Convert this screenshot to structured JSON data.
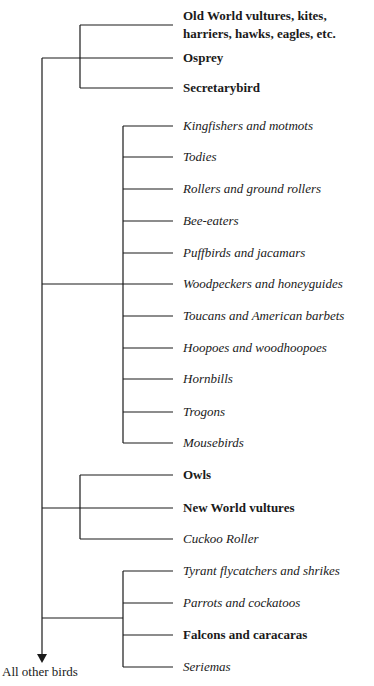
{
  "diagram": {
    "type": "cladogram",
    "root_label": "All other birds",
    "clades": [
      {
        "name": "clade-raptors-accipitriformes",
        "leaves": [
          {
            "label": "Old World vultures, kites, harriers, hawks, eagles, etc.",
            "style": "bold"
          },
          {
            "label": "Osprey",
            "style": "bold"
          },
          {
            "label": "Secretarybird",
            "style": "bold"
          }
        ]
      },
      {
        "name": "clade-coraciimorphae",
        "leaves": [
          {
            "label": "Kingfishers and motmots",
            "style": "italic"
          },
          {
            "label": "Todies",
            "style": "italic"
          },
          {
            "label": "Rollers and ground rollers",
            "style": "italic"
          },
          {
            "label": "Bee-eaters",
            "style": "italic"
          },
          {
            "label": "Puffbirds and jacamars",
            "style": "italic"
          },
          {
            "label": "Woodpeckers and honeyguides",
            "style": "italic"
          },
          {
            "label": "Toucans and American barbets",
            "style": "italic"
          },
          {
            "label": "Hoopoes and woodhoopoes",
            "style": "italic"
          },
          {
            "label": "Hornbills",
            "style": "italic"
          },
          {
            "label": "Trogons",
            "style": "italic"
          },
          {
            "label": "Mousebirds",
            "style": "italic"
          }
        ]
      },
      {
        "name": "clade-owls-vultures",
        "leaves": [
          {
            "label": "Owls",
            "style": "bold"
          },
          {
            "label": "New World vultures",
            "style": "bold"
          },
          {
            "label": "Cuckoo Roller",
            "style": "italic"
          }
        ]
      },
      {
        "name": "clade-australaves",
        "leaves": [
          {
            "label": "Tyrant flycatchers and shrikes",
            "style": "italic"
          },
          {
            "label": "Parrots and cockatoos",
            "style": "italic"
          },
          {
            "label": "Falcons and caracaras",
            "style": "bold"
          },
          {
            "label": "Seriemas",
            "style": "italic"
          }
        ]
      }
    ]
  }
}
